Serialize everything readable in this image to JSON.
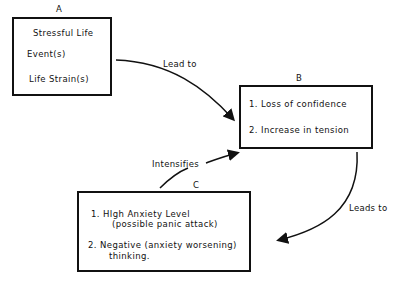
{
  "diagram": {
    "nodes": [
      {
        "id": "A",
        "label": "A",
        "lines": [
          "Stressful Life",
          "Event(s)",
          "Life Strain(s)"
        ]
      },
      {
        "id": "B",
        "label": "B",
        "items": [
          "1.   Loss of confidence",
          "2.   Increase in tension"
        ]
      },
      {
        "id": "C",
        "label": "C",
        "items": [
          "1.   HIgh Anxiety Level",
          "(possible panic attack)",
          "2.   Negative (anxiety worsening)",
          "thinking."
        ]
      }
    ],
    "edges": [
      {
        "from": "A",
        "to": "B",
        "label": "Lead to"
      },
      {
        "from": "B",
        "to": "C",
        "label": "Leads to"
      },
      {
        "from": "C",
        "to": "B",
        "label": "Intensifies"
      }
    ]
  }
}
